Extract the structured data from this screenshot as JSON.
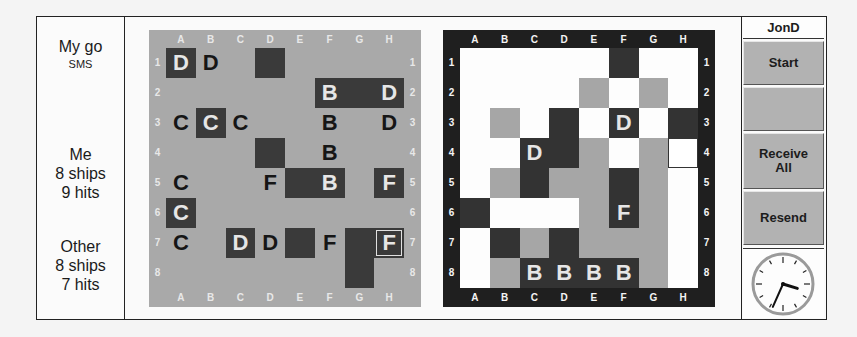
{
  "status": {
    "turn": "My go",
    "mode": "SMS"
  },
  "me": {
    "label": "Me",
    "ships": "8 ships",
    "hits": "9 hits"
  },
  "other": {
    "label": "Other",
    "ships": "8 ships",
    "hits": "7 hits"
  },
  "columns": [
    "A",
    "B",
    "C",
    "D",
    "E",
    "F",
    "G",
    "H"
  ],
  "rows": [
    "1",
    "2",
    "3",
    "4",
    "5",
    "6",
    "7",
    "8"
  ],
  "colors": {
    "my_board_bg": "#a9a9a9",
    "dark_cell": "#3a3a3a",
    "their_board_frame": "#1f1f1f",
    "their_board_bg": "#fdfdfd",
    "miss_gray": "#a6a6a6",
    "button_gray": "#b2b2b2"
  },
  "my_board": {
    "cells": [
      {
        "col": 0,
        "row": 0,
        "fill": "dark",
        "letter": "D"
      },
      {
        "col": 1,
        "row": 0,
        "fill": "none",
        "letter": "D"
      },
      {
        "col": 3,
        "row": 0,
        "fill": "dark",
        "letter": ""
      },
      {
        "col": 5,
        "row": 1,
        "fill": "dark",
        "letter": "B"
      },
      {
        "col": 6,
        "row": 1,
        "fill": "dark",
        "letter": ""
      },
      {
        "col": 7,
        "row": 1,
        "fill": "dark",
        "letter": "D"
      },
      {
        "col": 0,
        "row": 2,
        "fill": "none",
        "letter": "C"
      },
      {
        "col": 1,
        "row": 2,
        "fill": "dark",
        "letter": "C"
      },
      {
        "col": 2,
        "row": 2,
        "fill": "none",
        "letter": "C"
      },
      {
        "col": 5,
        "row": 2,
        "fill": "none",
        "letter": "B"
      },
      {
        "col": 7,
        "row": 2,
        "fill": "none",
        "letter": "D"
      },
      {
        "col": 3,
        "row": 3,
        "fill": "dark",
        "letter": ""
      },
      {
        "col": 5,
        "row": 3,
        "fill": "none",
        "letter": "B"
      },
      {
        "col": 0,
        "row": 4,
        "fill": "none",
        "letter": "C"
      },
      {
        "col": 3,
        "row": 4,
        "fill": "none",
        "letter": "F"
      },
      {
        "col": 4,
        "row": 4,
        "fill": "dark",
        "letter": ""
      },
      {
        "col": 5,
        "row": 4,
        "fill": "dark",
        "letter": "B"
      },
      {
        "col": 7,
        "row": 4,
        "fill": "dark",
        "letter": "F"
      },
      {
        "col": 0,
        "row": 5,
        "fill": "dark",
        "letter": "C"
      },
      {
        "col": 0,
        "row": 6,
        "fill": "none",
        "letter": "C"
      },
      {
        "col": 2,
        "row": 6,
        "fill": "dark",
        "letter": "D"
      },
      {
        "col": 3,
        "row": 6,
        "fill": "none",
        "letter": "D"
      },
      {
        "col": 4,
        "row": 6,
        "fill": "dark",
        "letter": ""
      },
      {
        "col": 5,
        "row": 6,
        "fill": "none",
        "letter": "F"
      },
      {
        "col": 6,
        "row": 6,
        "fill": "dark",
        "letter": ""
      },
      {
        "col": 7,
        "row": 6,
        "fill": "dark",
        "letter": "F",
        "selected": true
      },
      {
        "col": 6,
        "row": 7,
        "fill": "dark",
        "letter": ""
      }
    ]
  },
  "their_board": {
    "cells": [
      {
        "col": 5,
        "row": 0,
        "fill": "dark",
        "letter": ""
      },
      {
        "col": 4,
        "row": 1,
        "fill": "gray",
        "letter": ""
      },
      {
        "col": 6,
        "row": 1,
        "fill": "gray",
        "letter": ""
      },
      {
        "col": 1,
        "row": 2,
        "fill": "gray",
        "letter": ""
      },
      {
        "col": 3,
        "row": 2,
        "fill": "dark",
        "letter": ""
      },
      {
        "col": 5,
        "row": 2,
        "fill": "dark",
        "letter": "D"
      },
      {
        "col": 7,
        "row": 2,
        "fill": "dark",
        "letter": ""
      },
      {
        "col": 2,
        "row": 3,
        "fill": "dark",
        "letter": "D"
      },
      {
        "col": 3,
        "row": 3,
        "fill": "dark",
        "letter": ""
      },
      {
        "col": 4,
        "row": 3,
        "fill": "gray",
        "letter": ""
      },
      {
        "col": 6,
        "row": 3,
        "fill": "gray",
        "letter": ""
      },
      {
        "col": 7,
        "row": 3,
        "fill": "cursor",
        "letter": ""
      },
      {
        "col": 1,
        "row": 4,
        "fill": "gray",
        "letter": ""
      },
      {
        "col": 2,
        "row": 4,
        "fill": "dark",
        "letter": ""
      },
      {
        "col": 3,
        "row": 4,
        "fill": "gray",
        "letter": ""
      },
      {
        "col": 4,
        "row": 4,
        "fill": "gray",
        "letter": ""
      },
      {
        "col": 5,
        "row": 4,
        "fill": "dark",
        "letter": ""
      },
      {
        "col": 6,
        "row": 4,
        "fill": "gray",
        "letter": ""
      },
      {
        "col": 0,
        "row": 5,
        "fill": "dark",
        "letter": ""
      },
      {
        "col": 4,
        "row": 5,
        "fill": "gray",
        "letter": ""
      },
      {
        "col": 5,
        "row": 5,
        "fill": "dark",
        "letter": "F"
      },
      {
        "col": 6,
        "row": 5,
        "fill": "gray",
        "letter": ""
      },
      {
        "col": 1,
        "row": 6,
        "fill": "dark",
        "letter": ""
      },
      {
        "col": 2,
        "row": 6,
        "fill": "gray",
        "letter": ""
      },
      {
        "col": 3,
        "row": 6,
        "fill": "dark",
        "letter": ""
      },
      {
        "col": 4,
        "row": 6,
        "fill": "gray",
        "letter": ""
      },
      {
        "col": 5,
        "row": 6,
        "fill": "gray",
        "letter": ""
      },
      {
        "col": 6,
        "row": 6,
        "fill": "gray",
        "letter": ""
      },
      {
        "col": 1,
        "row": 7,
        "fill": "gray",
        "letter": ""
      },
      {
        "col": 2,
        "row": 7,
        "fill": "dark",
        "letter": "B"
      },
      {
        "col": 3,
        "row": 7,
        "fill": "dark",
        "letter": "B"
      },
      {
        "col": 4,
        "row": 7,
        "fill": "dark",
        "letter": "B"
      },
      {
        "col": 5,
        "row": 7,
        "fill": "dark",
        "letter": "B"
      },
      {
        "col": 6,
        "row": 7,
        "fill": "gray",
        "letter": ""
      }
    ]
  },
  "sidebar": {
    "opponent": "JonD",
    "buttons": [
      {
        "id": "start",
        "label": "Start"
      },
      {
        "id": "blank",
        "label": ""
      },
      {
        "id": "receive-all",
        "label": "Receive All"
      },
      {
        "id": "resend",
        "label": "Resend"
      }
    ]
  },
  "clock": {
    "hour": 3,
    "minute": 34
  }
}
